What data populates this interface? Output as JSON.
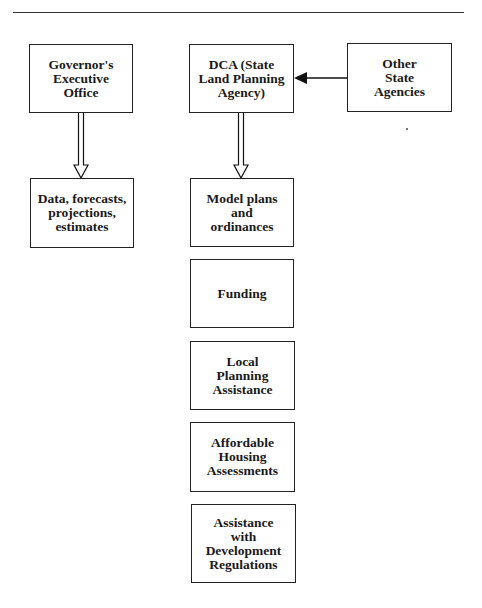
{
  "header": {
    "title_partial": "",
    "rule": true
  },
  "diagram": {
    "nodes": [
      {
        "id": "governor",
        "label": "Governor's\nExecutive\nOffice"
      },
      {
        "id": "dca",
        "label": "DCA (State\nLand Planning\nAgency)"
      },
      {
        "id": "other",
        "label": "Other\nState\nAgencies"
      },
      {
        "id": "data",
        "label": "Data, forecasts,\nprojections,\nestimates"
      },
      {
        "id": "model",
        "label": "Model plans\nand\nordinances"
      },
      {
        "id": "funding",
        "label": "Funding"
      },
      {
        "id": "local",
        "label": "Local\nPlanning\nAssistance"
      },
      {
        "id": "affordable",
        "label": "Affordable\nHousing\nAssessments"
      },
      {
        "id": "assistance",
        "label": "Assistance\nwith\nDevelopment\nRegulations"
      }
    ],
    "edges": [
      {
        "from": "other",
        "to": "dca",
        "style": "solid-arrow"
      },
      {
        "from": "governor",
        "to": "data",
        "style": "hollow-arrow"
      },
      {
        "from": "dca",
        "to": "model",
        "style": "hollow-arrow"
      }
    ]
  }
}
